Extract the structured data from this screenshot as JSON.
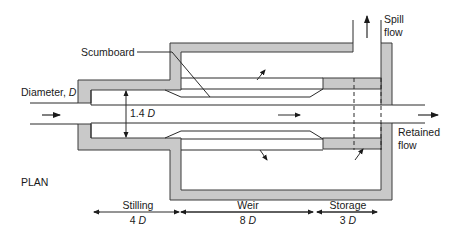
{
  "diagram": {
    "view_label": "PLAN",
    "labels": {
      "scumboard": "Scumboard",
      "diameter": "Diameter,",
      "diameter_symbol": "D",
      "inner_dim_value": "1.4",
      "inner_dim_symbol": "D",
      "spill_flow_line1": "Spill",
      "spill_flow_line2": "flow",
      "retained_flow_line1": "Retained",
      "retained_flow_line2": "flow"
    },
    "sections": [
      {
        "name": "Stilling",
        "value": "4",
        "symbol": "D"
      },
      {
        "name": "Weir",
        "value": "8",
        "symbol": "D"
      },
      {
        "name": "Storage",
        "value": "3",
        "symbol": "D"
      }
    ],
    "colors": {
      "wall_fill": "#c9c9c9",
      "line": "#2a2a2a",
      "background": "#ffffff"
    }
  }
}
